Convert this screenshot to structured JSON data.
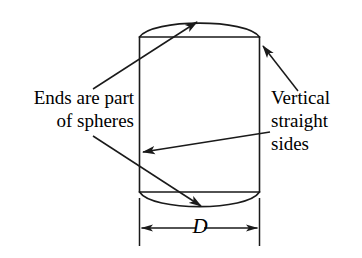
{
  "figure": {
    "type": "engineering-diagram",
    "stroke_color": "#1a1a1a",
    "background_color": "#ffffff",
    "annotations": {
      "left": {
        "name": "ends-are-part-of-spheres",
        "line1": "Ends are part",
        "line2": "of spheres",
        "align": "right"
      },
      "right": {
        "name": "vertical-straight-sides",
        "line1": "Vertical",
        "line2": "straight",
        "line3": "sides",
        "align": "left"
      }
    },
    "dimension": {
      "name": "diameter",
      "symbol": "D",
      "orientation": "horizontal",
      "style": "double-headed-arrow-with-extension-lines"
    },
    "geometry": {
      "rect_left_x": 139,
      "rect_right_x": 260,
      "rect_top_y": 37,
      "rect_bottom_y": 192,
      "top_arc_peak_y": 18,
      "bottom_arc_nadir_y": 210,
      "dimension_line_y": 228
    },
    "leaders": [
      {
        "name": "leader-ends-to-top-arc",
        "from": "left-text",
        "to": "top-spherical-cap",
        "arrowhead": "end"
      },
      {
        "name": "leader-spheres-to-bottom-arc",
        "from": "left-text",
        "to": "bottom-spherical-cap",
        "arrowhead": "end"
      },
      {
        "name": "leader-vertical-to-top-right-corner",
        "from": "right-text",
        "to": "right-vertical-side-top",
        "arrowhead": "end"
      },
      {
        "name": "leader-straight-to-left-side",
        "from": "right-text",
        "to": "left-vertical-side",
        "arrowhead": "end"
      }
    ]
  }
}
